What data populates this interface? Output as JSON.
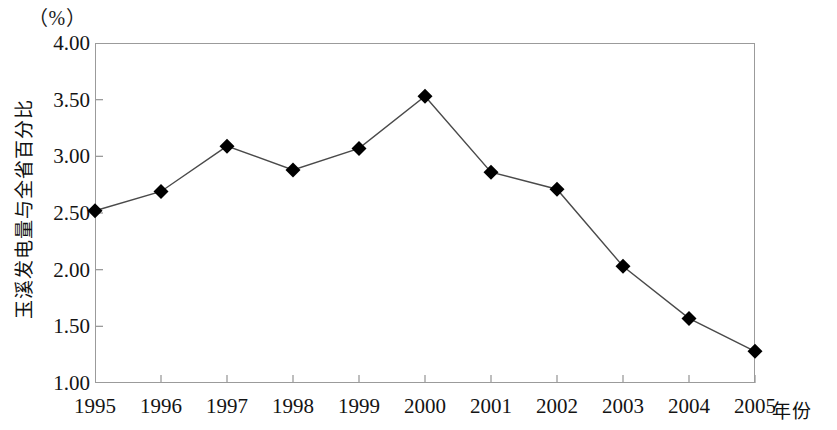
{
  "chart_data": {
    "type": "line",
    "title": "",
    "subtitle": "",
    "xlabel": "年份",
    "ylabel": "玉溪发电量与全省百分比",
    "unit_label": "（%）",
    "categories": [
      "1995",
      "1996",
      "1997",
      "1998",
      "1999",
      "2000",
      "2001",
      "2002",
      "2003",
      "2004",
      "2005"
    ],
    "values": [
      2.52,
      2.69,
      3.09,
      2.88,
      3.07,
      3.53,
      2.86,
      2.71,
      2.03,
      1.57,
      1.28
    ],
    "series": [
      {
        "name": "玉溪发电量与全省百分比",
        "values": [
          2.52,
          2.69,
          3.09,
          2.88,
          3.07,
          3.53,
          2.86,
          2.71,
          2.03,
          1.57,
          1.28
        ]
      }
    ],
    "ylim": [
      1.0,
      4.0
    ],
    "ytick_labels": [
      "1.00",
      "1.50",
      "2.00",
      "2.50",
      "3.00",
      "3.50",
      "4.00"
    ],
    "ytick_values": [
      1.0,
      1.5,
      2.0,
      2.5,
      3.0,
      3.5,
      4.0
    ],
    "xtick_labels": [
      "1995",
      "1996",
      "1997",
      "1998",
      "1999",
      "2000",
      "2001",
      "2002",
      "2003",
      "2004",
      "2005"
    ],
    "grid": false,
    "legend": "none",
    "marker": "diamond",
    "line_color": "#4a4a4a",
    "marker_color": "#000000",
    "frame_color": "#9b9b9b",
    "background_color": "#ffffff"
  }
}
